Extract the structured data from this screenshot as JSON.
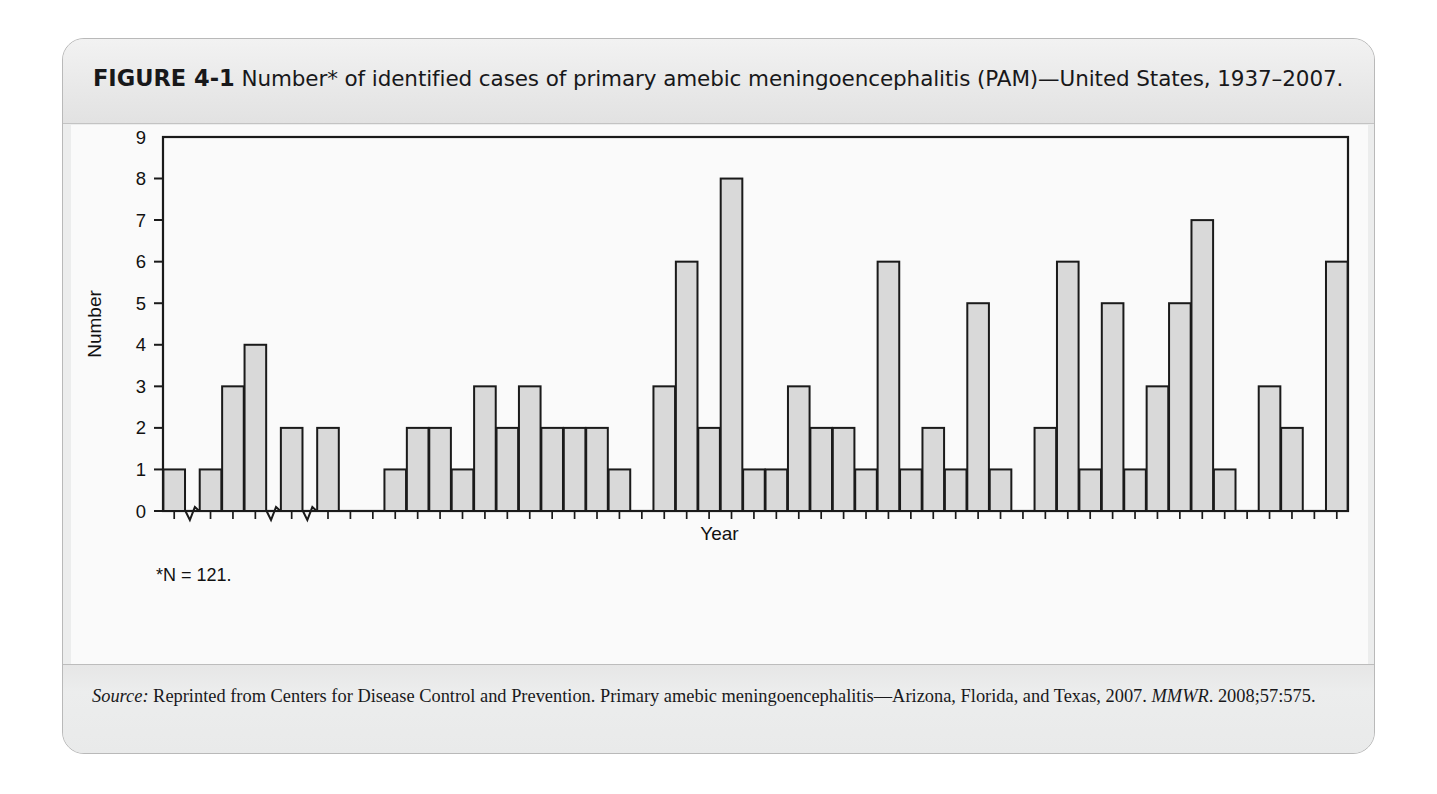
{
  "figure": {
    "label": "FIGURE 4-1",
    "caption": "Number* of identified cases of primary amebic meningoencephalitis (PAM)—United States, 1937–2007.",
    "footnote": "*N = 121.",
    "source_prefix": "Source:",
    "source_body": " Reprinted from Centers for Disease Control and Prevention. Primary amebic meningoencephalitis—Arizona, Florida, and Texas, 2007. ",
    "source_italic": "MMWR",
    "source_tail": ". 2008;57:575."
  },
  "colors": {
    "bar_fill": "#d9d9d9",
    "bar_stroke": "#1a1a1a",
    "panel_bg": "#fafafa",
    "frame": "#1a1a1a",
    "header_bg": "#ececec"
  },
  "chart_data": {
    "type": "bar",
    "title": "Number* of identified cases of primary amebic meningoencephalitis (PAM)—United States, 1937–2007.",
    "xlabel": "Year",
    "ylabel": "Number",
    "ylim": [
      0,
      9
    ],
    "yticks": [
      0,
      1,
      2,
      3,
      4,
      5,
      6,
      7,
      8,
      9
    ],
    "grid": false,
    "legend": "none",
    "total_n": 121,
    "axis_breaks": [
      {
        "after_year": 1937,
        "before_year": 1950
      },
      {
        "after_year": 1952,
        "before_year": 1957
      },
      {
        "after_year": 1957,
        "before_year": 1962
      }
    ],
    "xtick_labels": [
      "1937",
      "1950",
      "1957",
      "1962",
      "1967",
      "1972",
      "1977",
      "1982",
      "1987",
      "1992",
      "1997",
      "2002",
      "2007"
    ],
    "categories": [
      1937,
      1950,
      1951,
      1952,
      1957,
      1962,
      1963,
      1964,
      1965,
      1966,
      1967,
      1968,
      1969,
      1970,
      1971,
      1972,
      1973,
      1974,
      1975,
      1976,
      1977,
      1978,
      1979,
      1980,
      1981,
      1982,
      1983,
      1984,
      1985,
      1986,
      1987,
      1988,
      1989,
      1990,
      1991,
      1992,
      1993,
      1994,
      1995,
      1996,
      1997,
      1998,
      1999,
      2000,
      2001,
      2002,
      2003,
      2004,
      2005,
      2006,
      2007
    ],
    "values": [
      1,
      1,
      3,
      4,
      2,
      2,
      0,
      0,
      1,
      2,
      2,
      1,
      3,
      2,
      3,
      2,
      2,
      2,
      1,
      0,
      3,
      6,
      2,
      8,
      1,
      1,
      3,
      2,
      2,
      1,
      6,
      1,
      2,
      1,
      5,
      1,
      0,
      2,
      6,
      1,
      5,
      1,
      3,
      5,
      7,
      1,
      0,
      3,
      2,
      0,
      6
    ]
  }
}
